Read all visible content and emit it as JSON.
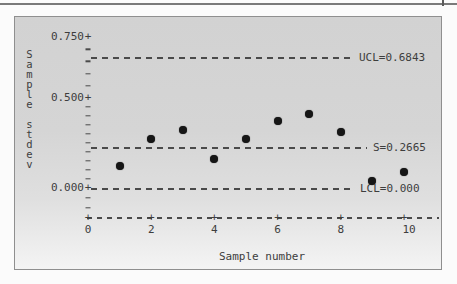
{
  "chart_data": {
    "type": "scatter",
    "subtype": "s-control-chart",
    "title": "",
    "xlabel": "Sample number",
    "ylabel": "Sample stdev",
    "x": [
      1,
      2,
      3,
      4,
      5,
      6,
      7,
      8,
      9,
      10
    ],
    "values": [
      0.12,
      0.27,
      0.32,
      0.16,
      0.27,
      0.37,
      0.41,
      0.31,
      0.04,
      0.09
    ],
    "xlim": [
      0,
      11
    ],
    "ylim": [
      0,
      0.78
    ],
    "x_ticks": {
      "values": [
        0,
        2,
        4,
        6,
        8,
        10
      ],
      "labels": [
        "0",
        "2",
        "4",
        "6",
        "8",
        "10"
      ]
    },
    "y_ticks": {
      "values": [
        0.75,
        0.5,
        0.0
      ],
      "labels": [
        "0.750",
        "0.500",
        "0.000"
      ]
    },
    "ref_lines": [
      {
        "name": "UCL",
        "label": "UCL=0.6843",
        "value": 0.6843
      },
      {
        "name": "S",
        "label": "S=0.2665",
        "value": 0.2665
      },
      {
        "name": "LCL",
        "label": "LCL=0.000",
        "value": 0.0
      }
    ],
    "grid": "off",
    "legend": "none",
    "marker": "filled-circle",
    "colors": {
      "marker": "#161616",
      "line": "#4a4a4a",
      "text": "#3d3d3d",
      "plot_bg": "#d5d5d5"
    }
  }
}
